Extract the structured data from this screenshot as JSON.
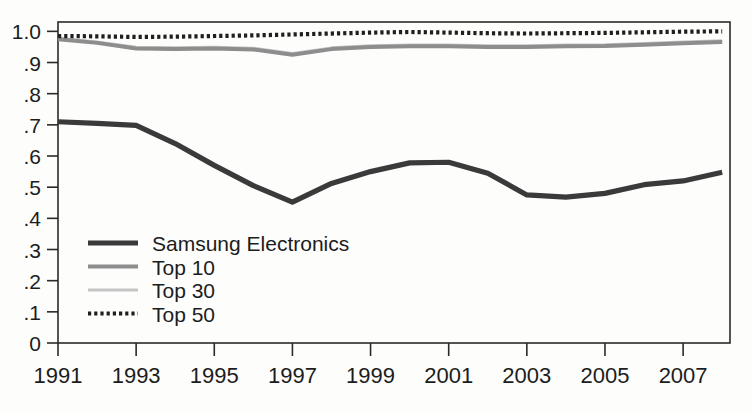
{
  "chart_data": {
    "type": "line",
    "title": "",
    "xlabel": "",
    "ylabel": "",
    "xlim": [
      1991,
      2008.2
    ],
    "ylim": [
      0,
      1.03
    ],
    "grid": false,
    "legend_position": "inside-lower-left",
    "ytick_labels": [
      "1.0",
      ".9",
      ".8",
      ".7",
      ".6",
      ".5",
      ".4",
      ".3",
      ".2",
      ".1",
      "0"
    ],
    "ytick_values": [
      1.0,
      0.9,
      0.8,
      0.7,
      0.6,
      0.5,
      0.4,
      0.3,
      0.2,
      0.1,
      0
    ],
    "xtick_labels": [
      "1991",
      "1993",
      "1995",
      "1997",
      "1999",
      "2001",
      "2003",
      "2005",
      "2007"
    ],
    "xtick_values": [
      1991,
      1993,
      1995,
      1997,
      1999,
      2001,
      2003,
      2005,
      2007
    ],
    "x": [
      1991,
      1992,
      1993,
      1994,
      1995,
      1996,
      1997,
      1998,
      1999,
      2000,
      2001,
      2002,
      2003,
      2004,
      2005,
      2006,
      2007,
      2008
    ],
    "series": [
      {
        "name": "Samsung Electronics",
        "color": "#3a3a3a",
        "style": "solid-thick",
        "values": [
          0.71,
          0.705,
          0.698,
          0.64,
          0.57,
          0.505,
          0.452,
          0.512,
          0.55,
          0.578,
          0.58,
          0.545,
          0.475,
          0.468,
          0.48,
          0.508,
          0.52,
          0.548
        ]
      },
      {
        "name": "Top 10",
        "color": "#8d8d8d",
        "style": "solid-medium",
        "values": [
          0.975,
          0.963,
          0.945,
          0.943,
          0.945,
          0.942,
          0.925,
          0.943,
          0.95,
          0.952,
          0.952,
          0.95,
          0.95,
          0.952,
          0.953,
          0.957,
          0.962,
          0.966
        ]
      },
      {
        "name": "Top 30",
        "color": "#c6c6c6",
        "style": "solid-thin",
        "values": [
          0.978,
          0.966,
          0.949,
          0.947,
          0.949,
          0.946,
          0.929,
          0.947,
          0.954,
          0.956,
          0.956,
          0.954,
          0.954,
          0.956,
          0.957,
          0.961,
          0.966,
          0.97
        ]
      },
      {
        "name": "Top 50",
        "color": "#1f1f1f",
        "style": "dotted",
        "values": [
          0.985,
          0.984,
          0.982,
          0.983,
          0.985,
          0.987,
          0.99,
          0.993,
          0.996,
          0.998,
          0.996,
          0.994,
          0.993,
          0.994,
          0.995,
          0.997,
          0.999,
          1.0
        ]
      }
    ]
  },
  "legend": {
    "items": [
      {
        "label": "Samsung Electronics"
      },
      {
        "label": "Top 10"
      },
      {
        "label": "Top 30"
      },
      {
        "label": "Top 50"
      }
    ]
  },
  "colors": {
    "background": "#fdfdfc",
    "axis": "#2a2a2a",
    "samsung": "#3a3a3a",
    "top10": "#8d8d8d",
    "top30": "#c6c6c6",
    "top50": "#1f1f1f"
  }
}
